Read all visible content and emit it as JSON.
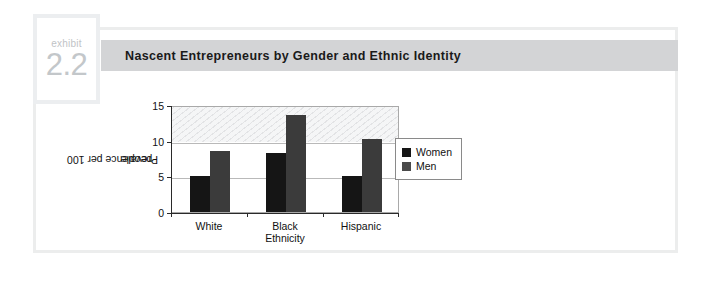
{
  "exhibit": {
    "kicker": "exhibit",
    "number": "2.2"
  },
  "header": {
    "title": "Nascent Entrepreneurs by Gender and Ethnic Identity",
    "bar_color": "#d3d4d6"
  },
  "chart_data": {
    "type": "bar",
    "title": "Nascent Entrepreneurs by Gender and Ethnic Identity",
    "categories": [
      "White",
      "Black",
      "Hispanic"
    ],
    "series": [
      {
        "name": "Women",
        "values": [
          5.0,
          8.3,
          5.0
        ],
        "color": "#151515"
      },
      {
        "name": "Men",
        "values": [
          8.6,
          13.6,
          10.3
        ],
        "color": "#3b3b3b"
      }
    ],
    "xlabel": "Ethnicity",
    "ylabel": "Prevalence per 100 people",
    "ylabel_line1": "Prevalence per 100",
    "ylabel_line2": "people",
    "ylim": [
      0,
      15
    ],
    "yticks": [
      0,
      5,
      10,
      15
    ],
    "ytick_labels": [
      "0",
      "5",
      "10",
      "15"
    ],
    "grid": true,
    "legend_position": "right",
    "legend": [
      "Women",
      "Men"
    ]
  },
  "colors": {
    "women_bar": "#151515",
    "men_bar": "#3b3b3b",
    "card_border": "#eceded",
    "badge_border": "#eceef0",
    "badge_text": "#c3c7ca",
    "axis": "#2a2a2a",
    "gridline": "#b9b9b9"
  }
}
